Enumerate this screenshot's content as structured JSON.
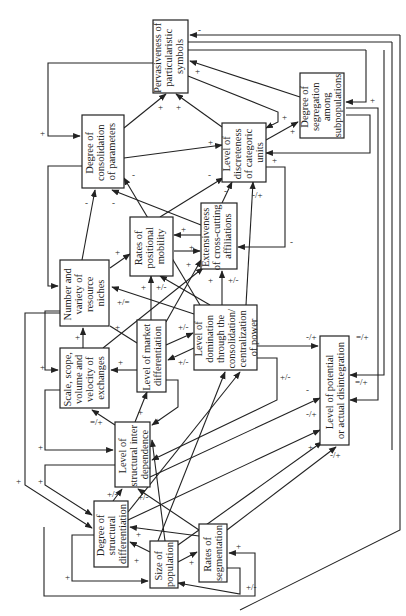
{
  "diagram": {
    "orientation": "rotated -90deg",
    "nodes": {
      "pervasiveness": {
        "lines": [
          "Pervasiveness of",
          "particularistic",
          "symbols"
        ]
      },
      "segregation": {
        "lines": [
          "Degree of",
          "segregation",
          "among",
          "subpopulations"
        ]
      },
      "consolidation": {
        "lines": [
          "Degree of",
          "consolidation",
          "of parameters"
        ]
      },
      "discreteness": {
        "lines": [
          "Level of",
          "discreteness",
          "of categoric",
          "units"
        ]
      },
      "mobility": {
        "lines": [
          "Rates of",
          "positional",
          "mobility"
        ]
      },
      "crosscutting": {
        "lines": [
          "Extensiveness",
          "of cross-cutting",
          "affiliations"
        ]
      },
      "niches": {
        "lines": [
          "Number and",
          "variety of",
          "resource",
          "niches"
        ]
      },
      "market": {
        "lines": [
          "Level of market",
          "differentiation"
        ]
      },
      "domination": {
        "lines": [
          "Level of",
          "domination",
          "through the",
          "consolidation/",
          "centralization",
          "of power"
        ]
      },
      "scale": {
        "lines": [
          "Scale, scope,",
          "volume and",
          "velocity of",
          "exchanges"
        ]
      },
      "disintegration": {
        "lines": [
          "Level of potential",
          "or actual disintegration"
        ]
      },
      "interdependence": {
        "lines": [
          "Level of",
          "structural inter",
          "dependence"
        ]
      },
      "structdiff": {
        "lines": [
          "Degree of",
          "structural",
          "differentiation"
        ]
      },
      "population": {
        "lines": [
          "Size of",
          "population"
        ]
      },
      "segmentation": {
        "lines": [
          "Rates of",
          "segmentation"
        ]
      }
    },
    "edge_labels": [
      "+",
      "-",
      "+/-",
      "-/+",
      "=/+",
      "+/=",
      "+/-"
    ]
  }
}
